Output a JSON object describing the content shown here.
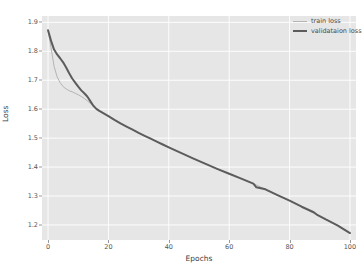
{
  "chart_data": {
    "type": "line",
    "title": "",
    "xlabel": "Epochs",
    "ylabel": "Loss",
    "xlim": [
      -2,
      102
    ],
    "ylim": [
      1.148,
      1.922
    ],
    "grid": true,
    "legend_position": "top-right",
    "xticks": [
      "0",
      "20",
      "40",
      "60",
      "80",
      "100"
    ],
    "xtick_values": [
      0,
      20,
      40,
      60,
      80,
      100
    ],
    "yticks": [
      "1.2",
      "1.3",
      "1.4",
      "1.5",
      "1.6",
      "1.7",
      "1.8",
      "1.9"
    ],
    "ytick_values": [
      1.2,
      1.3,
      1.4,
      1.5,
      1.6,
      1.7,
      1.8,
      1.9
    ],
    "series": [
      {
        "name": "train loss",
        "color": "#b4b4b4",
        "linewidth": 1,
        "x": [
          0,
          1,
          2,
          3,
          4,
          5,
          6,
          7,
          8,
          9,
          10,
          11,
          12,
          13,
          14,
          15,
          16,
          17,
          18,
          19,
          20,
          22,
          24,
          26,
          28,
          30,
          32,
          34,
          36,
          38,
          40,
          44,
          48,
          52,
          56,
          60,
          64,
          68,
          72,
          76,
          80,
          84,
          88,
          92,
          96,
          100
        ],
        "values": [
          1.873,
          1.812,
          1.748,
          1.712,
          1.692,
          1.678,
          1.67,
          1.664,
          1.66,
          1.655,
          1.65,
          1.644,
          1.637,
          1.629,
          1.62,
          1.611,
          1.601,
          1.594,
          1.588,
          1.582,
          1.576,
          1.563,
          1.551,
          1.54,
          1.529,
          1.518,
          1.508,
          1.498,
          1.488,
          1.478,
          1.468,
          1.449,
          1.43,
          1.412,
          1.394,
          1.377,
          1.36,
          1.343,
          1.323,
          1.303,
          1.284,
          1.263,
          1.24,
          1.219,
          1.198,
          1.172
        ]
      },
      {
        "name": "validataion loss",
        "color": "#5c5c5c",
        "linewidth": 2,
        "x": [
          0,
          1,
          2,
          3,
          4,
          5,
          6,
          7,
          8,
          9,
          10,
          11,
          12,
          13,
          14,
          15,
          16,
          17,
          18,
          19,
          20,
          22,
          24,
          26,
          28,
          30,
          32,
          34,
          36,
          38,
          40,
          44,
          48,
          52,
          56,
          60,
          64,
          68,
          69,
          72,
          76,
          80,
          84,
          88,
          89,
          92,
          96,
          100
        ],
        "values": [
          1.873,
          1.836,
          1.806,
          1.789,
          1.776,
          1.762,
          1.744,
          1.724,
          1.706,
          1.692,
          1.678,
          1.665,
          1.655,
          1.644,
          1.628,
          1.612,
          1.601,
          1.594,
          1.588,
          1.582,
          1.576,
          1.563,
          1.551,
          1.54,
          1.529,
          1.518,
          1.508,
          1.498,
          1.488,
          1.478,
          1.468,
          1.449,
          1.43,
          1.412,
          1.394,
          1.377,
          1.36,
          1.343,
          1.33,
          1.323,
          1.303,
          1.284,
          1.263,
          1.244,
          1.236,
          1.219,
          1.198,
          1.172
        ]
      }
    ]
  },
  "legend": {
    "entries": [
      {
        "label": "train loss"
      },
      {
        "label": "validataion loss"
      }
    ]
  },
  "axes": {
    "x_title": "Epochs",
    "y_title": "Loss"
  }
}
